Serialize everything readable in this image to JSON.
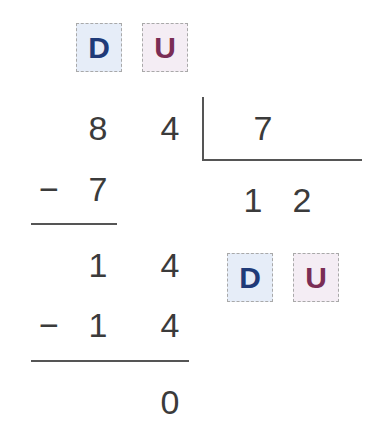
{
  "colors": {
    "tens_box_bg": "#e6edf8",
    "tens_text": "#1f3a78",
    "units_box_bg": "#f4edf4",
    "units_text": "#7a2d55"
  },
  "place_value_headers": {
    "top": {
      "tens": "D",
      "units": "U"
    },
    "quotient": {
      "tens": "D",
      "units": "U"
    }
  },
  "division": {
    "dividend": [
      "8",
      "4"
    ],
    "divisor": "7",
    "quotient": [
      "1",
      "2"
    ],
    "steps": [
      {
        "minus": "−",
        "subtract": [
          "7"
        ]
      },
      {
        "bring_down": [
          "1",
          "4"
        ]
      },
      {
        "minus": "−",
        "subtract": [
          "1",
          "4"
        ]
      },
      {
        "remainder": "0"
      }
    ]
  }
}
